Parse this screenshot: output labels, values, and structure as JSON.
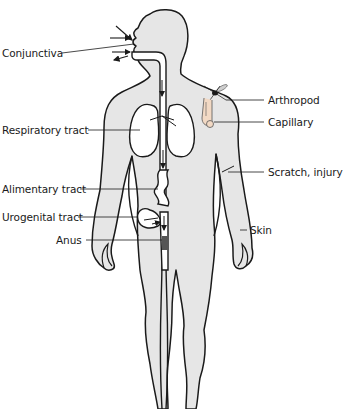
{
  "figure": {
    "type": "anatomical-diagram",
    "colors": {
      "body_fill": "#e6e6e6",
      "outline": "#1a1a1a",
      "organ_fill": "#ffffff",
      "background": "#ffffff"
    }
  },
  "labels": {
    "left": [
      {
        "id": "conjunctiva",
        "text": "Conjunctiva"
      },
      {
        "id": "respiratory",
        "text": "Respiratory tract"
      },
      {
        "id": "alimentary",
        "text": "Alimentary tract"
      },
      {
        "id": "urogenital",
        "text": "Urogenital tract"
      },
      {
        "id": "anus",
        "text": "Anus"
      }
    ],
    "right": [
      {
        "id": "arthropod",
        "text": "Arthropod"
      },
      {
        "id": "capillary",
        "text": "Capillary"
      },
      {
        "id": "scratch",
        "text": "Scratch, injury"
      },
      {
        "id": "skin",
        "text": "Skin"
      }
    ]
  }
}
